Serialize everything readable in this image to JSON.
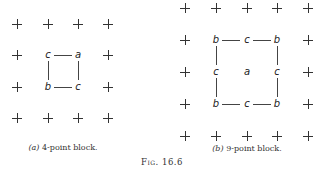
{
  "figure": {
    "number_label": "Fig. 16.6",
    "panels": [
      {
        "id": "a",
        "caption_tag": "(a)",
        "caption_text": "4-point block.",
        "grid": {
          "cols": 4,
          "rows": 4
        },
        "nodes": [
          {
            "label": "c",
            "row": 1,
            "col": 1
          },
          {
            "label": "a",
            "row": 1,
            "col": 2
          },
          {
            "label": "b",
            "row": 2,
            "col": 1
          },
          {
            "label": "c",
            "row": 2,
            "col": 2
          }
        ],
        "edges": [
          [
            "c(1,1)",
            "a(1,2)"
          ],
          [
            "c(1,1)",
            "b(2,1)"
          ],
          [
            "a(1,2)",
            "c(2,2)"
          ],
          [
            "b(2,1)",
            "c(2,2)"
          ]
        ]
      },
      {
        "id": "b",
        "caption_tag": "(b)",
        "caption_text": "9-point block.",
        "grid": {
          "cols": 5,
          "rows": 5
        },
        "nodes": [
          {
            "label": "b",
            "row": 1,
            "col": 1
          },
          {
            "label": "c",
            "row": 1,
            "col": 2
          },
          {
            "label": "b",
            "row": 1,
            "col": 3
          },
          {
            "label": "c",
            "row": 2,
            "col": 1
          },
          {
            "label": "a",
            "row": 2,
            "col": 2
          },
          {
            "label": "c",
            "row": 2,
            "col": 3
          },
          {
            "label": "b",
            "row": 3,
            "col": 1
          },
          {
            "label": "c",
            "row": 3,
            "col": 2
          },
          {
            "label": "b",
            "row": 3,
            "col": 3
          }
        ],
        "edges": [
          [
            "b(1,1)",
            "c(1,2)"
          ],
          [
            "c(1,2)",
            "b(1,3)"
          ],
          [
            "b(3,1)",
            "c(3,2)"
          ],
          [
            "c(3,2)",
            "b(3,3)"
          ],
          [
            "b(1,1)",
            "c(2,1)"
          ],
          [
            "c(2,1)",
            "b(3,1)"
          ],
          [
            "b(1,3)",
            "c(2,3)"
          ],
          [
            "c(2,3)",
            "b(3,3)"
          ]
        ]
      }
    ]
  }
}
